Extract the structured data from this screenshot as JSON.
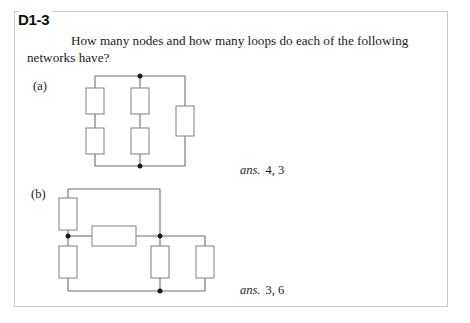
{
  "page": {
    "exercise_number": "D1-3",
    "question": "How many nodes and how many loops do each of the following networks have?",
    "border_color": "#c9c9c9",
    "background_color": "#ffffff"
  },
  "parts": [
    {
      "id": "a",
      "label": "(a)",
      "answer_word": "ans.",
      "answer_value": "4, 3",
      "nodes": 4,
      "loops": 3,
      "resistor_count": 5,
      "node_dot_count": 2
    },
    {
      "id": "b",
      "label": "(b)",
      "answer_word": "ans.",
      "answer_value": "3, 6",
      "nodes": 3,
      "loops": 6,
      "resistor_count": 5,
      "node_dot_count": 3
    }
  ],
  "colors": {
    "wire": "#6d6d6d",
    "resistor_outline": "#8a8a8a",
    "node_dot": "#1c1c1c",
    "text": "#1a1a1a"
  }
}
